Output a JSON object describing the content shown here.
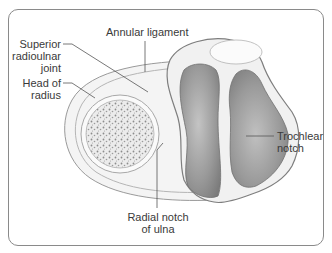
{
  "figure": {
    "labels": {
      "annular_ligament": "Annular ligament",
      "superior_radioulnar_joint": "Superior\nradioulnar\njoint",
      "head_of_radius": "Head of\nradius",
      "trochlear_notch": "Trochlear\nnotch",
      "radial_notch_of_ulna": "Radial notch\nof ulna"
    },
    "colors": {
      "frame_border": "#8a8a8a",
      "label_text": "#3a3a3a",
      "leader_line": "#555555",
      "ligament_fill": "#f2f2f2",
      "bone_spongy": "#dcdcdc",
      "articular_cartilage": "#8f8f8f"
    }
  }
}
